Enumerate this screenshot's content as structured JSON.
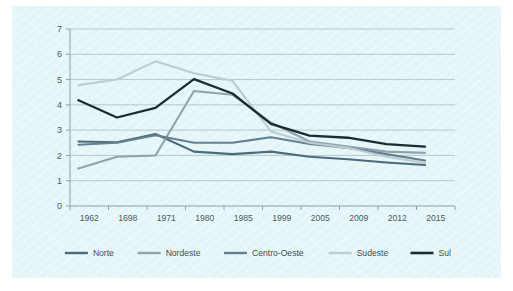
{
  "figure": {
    "background_color": "#ffffff",
    "panel_color": "#e4f5f7",
    "grid_color": "#9bb4bd",
    "axis_color": "#7f99a3",
    "text_color": "#4a5a63"
  },
  "chart_data": {
    "type": "line",
    "title": "",
    "subtitle": "",
    "xlabel": "",
    "ylabel": "",
    "categories": [
      "1962",
      "1698",
      "1971",
      "1980",
      "1985",
      "1999",
      "2005",
      "2009",
      "2012",
      "2015"
    ],
    "ylim": [
      0,
      7
    ],
    "yticks": [
      "0",
      "1",
      "2",
      "3",
      "4",
      "5",
      "6",
      "7"
    ],
    "grid": "horizontal",
    "legend_position": "bottom",
    "series": [
      {
        "name": "Norte",
        "color": "#4d6a78",
        "width": 2.1,
        "values": [
          2.55,
          2.52,
          2.85,
          2.15,
          2.05,
          2.15,
          1.95,
          1.85,
          1.72,
          1.62
        ]
      },
      {
        "name": "Nordeste",
        "color": "#8fa3ad",
        "width": 2.1,
        "values": [
          1.48,
          1.95,
          2.0,
          4.55,
          4.4,
          3.3,
          2.55,
          2.35,
          2.15,
          2.1
        ]
      },
      {
        "name": "Centro-Oeste",
        "color": "#64808f",
        "width": 2.1,
        "values": [
          2.42,
          2.5,
          2.8,
          2.5,
          2.5,
          2.72,
          2.45,
          2.3,
          2.05,
          1.8
        ]
      },
      {
        "name": "Sudeste",
        "color": "#bcccd3",
        "width": 2.1,
        "values": [
          4.78,
          5.0,
          5.72,
          5.25,
          4.95,
          2.95,
          2.5,
          2.3,
          1.95,
          1.7
        ]
      },
      {
        "name": "Sul",
        "color": "#1c2b33",
        "width": 2.3,
        "values": [
          4.18,
          3.5,
          3.88,
          5.02,
          4.45,
          3.25,
          2.78,
          2.7,
          2.45,
          2.35
        ]
      }
    ]
  }
}
